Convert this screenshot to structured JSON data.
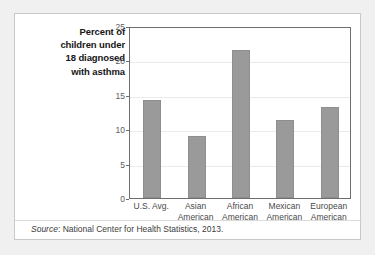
{
  "figure": {
    "title_lines": [
      "Percent of",
      "children under",
      "18 diagnosed",
      "with asthma"
    ],
    "title_text": "Percent of children under 18 diagnosed with asthma",
    "source_label": "Source",
    "source_separator": ":",
    "source_text": "National Center for Health Statistics, 2013.",
    "source_full": "Source: National Center for Health Statistics, 2013.",
    "colors": {
      "bar_fill": "#9a9a9a",
      "bar_border": "#8e8e8e",
      "plot_border": "#6e6e6e",
      "gridline": "#ebebeb",
      "card_background": "#ffffff",
      "card_border": "#c9c9c9",
      "page_background": "#f0f0f0",
      "tick_text": "#5b5b5b",
      "title_text": "#161616"
    }
  },
  "chart_data": {
    "type": "bar",
    "xlabel": "",
    "ylabel": "Percent of children under 18 diagnosed with asthma",
    "ylim": [
      0,
      25
    ],
    "yticks": [
      0,
      5,
      10,
      15,
      20,
      25
    ],
    "ytick_labels": [
      "0",
      "5",
      "10",
      "15",
      "20",
      "25"
    ],
    "grid": true,
    "grid_axis": "y",
    "legend": false,
    "categories": [
      "U.S. Avg.",
      "Asian American",
      "African American",
      "Mexican American",
      "European American"
    ],
    "category_lines": [
      [
        "U.S. Avg."
      ],
      [
        "Asian",
        "American"
      ],
      [
        "African",
        "American"
      ],
      [
        "Mexican",
        "American"
      ],
      [
        "European",
        "American"
      ]
    ],
    "values": [
      14.3,
      9.0,
      21.5,
      11.3,
      13.2
    ],
    "value_unit": "percent",
    "source": "National Center for Health Statistics, 2013."
  }
}
